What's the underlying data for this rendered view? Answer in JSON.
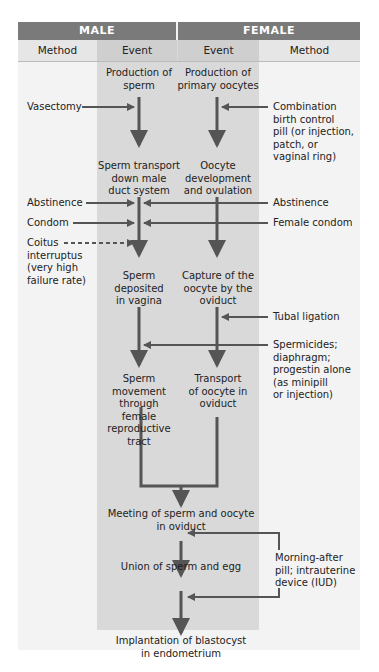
{
  "header": {
    "male": "MALE",
    "female": "FEMALE",
    "columns": [
      "Method",
      "Event",
      "Event",
      "Method"
    ]
  },
  "male_events": [
    "Production of\nsperm",
    "Sperm transport\ndown male\nduct system",
    "Sperm\ndeposited\nin vagina",
    "Sperm\nmovement\nthrough\nfemale\nreproductive\ntract"
  ],
  "female_events": [
    "Production of\nprimary oocytes",
    "Oocyte\ndevelopment\nand ovulation",
    "Capture of the\noocyte by the\noviduct",
    "Transport\nof oocyte in\noviduct"
  ],
  "shared_events": [
    "Meeting of sperm and oocyte\nin oviduct",
    "Union of sperm and egg",
    "Implantation of blastocyst\nin endometrium"
  ],
  "male_methods": [
    "Vasectomy",
    "Abstinence",
    "Condom",
    "Coitus\ninterruptus\n(very high\nfailure rate)"
  ],
  "female_methods": [
    "Combination\nbirth control\npill (or injection,\npatch, or\nvaginal ring)",
    "Abstinence",
    "Female condom",
    "Tubal ligation",
    "Spermicides;\ndiaphragm;\nprogestin alone\n(as minipill\nor injection)",
    "Morning-after\npill; intrauterine\ndevice (IUD)"
  ],
  "colors": {
    "header_bg": "#7a7a7a",
    "event_column_bg": "#d9d9d9",
    "method_column_bg": "#f3f3f3",
    "arrow": "#555555"
  }
}
